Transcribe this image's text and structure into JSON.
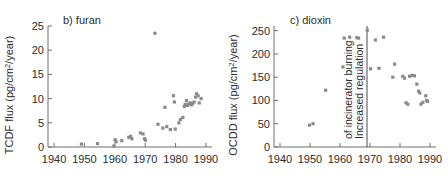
{
  "figure": {
    "marker_color": "#8a8a8a",
    "axis_color": "#6e6e6e",
    "text_color": "#2b2b2b"
  },
  "chart_data": [
    {
      "type": "scatter",
      "panel_id": "b",
      "title": "b) furan",
      "xlabel": "",
      "ylabel": "TCDF flux (pg/cm2/year)",
      "ylabel_main": "TCDF flux (pg/cm",
      "ylabel_sup": "2",
      "ylabel_tail": "/year)",
      "xlim": [
        1938,
        1992
      ],
      "ylim": [
        0,
        25
      ],
      "xticks": [
        1940,
        1950,
        1960,
        1970,
        1980,
        1990
      ],
      "yticks": [
        0,
        5,
        10,
        15,
        20,
        25
      ],
      "grid": false,
      "legend": "none",
      "points": [
        {
          "x": 1949.0,
          "y": 0.6
        },
        {
          "x": 1954.3,
          "y": 0.7
        },
        {
          "x": 1959.7,
          "y": 0.2
        },
        {
          "x": 1960.1,
          "y": 1.5
        },
        {
          "x": 1960.4,
          "y": 1.1
        },
        {
          "x": 1962.3,
          "y": 1.3
        },
        {
          "x": 1964.6,
          "y": 2.0
        },
        {
          "x": 1965.2,
          "y": 2.2
        },
        {
          "x": 1965.6,
          "y": 1.7
        },
        {
          "x": 1968.4,
          "y": 2.9
        },
        {
          "x": 1969.3,
          "y": 2.7
        },
        {
          "x": 1969.8,
          "y": 1.7
        },
        {
          "x": 1970.1,
          "y": 1.4
        },
        {
          "x": 1973.2,
          "y": 23.5
        },
        {
          "x": 1974.2,
          "y": 4.7
        },
        {
          "x": 1975.8,
          "y": 3.9
        },
        {
          "x": 1976.5,
          "y": 8.2
        },
        {
          "x": 1977.1,
          "y": 4.2
        },
        {
          "x": 1978.3,
          "y": 3.6
        },
        {
          "x": 1979.3,
          "y": 10.6
        },
        {
          "x": 1979.6,
          "y": 9.3
        },
        {
          "x": 1979.9,
          "y": 3.7
        },
        {
          "x": 1981.1,
          "y": 5.0
        },
        {
          "x": 1981.6,
          "y": 5.7
        },
        {
          "x": 1982.4,
          "y": 6.1
        },
        {
          "x": 1982.9,
          "y": 8.4
        },
        {
          "x": 1983.2,
          "y": 8.8
        },
        {
          "x": 1983.6,
          "y": 9.6
        },
        {
          "x": 1983.9,
          "y": 8.6
        },
        {
          "x": 1984.4,
          "y": 8.9
        },
        {
          "x": 1984.8,
          "y": 9.1
        },
        {
          "x": 1985.2,
          "y": 8.7
        },
        {
          "x": 1985.6,
          "y": 9.0
        },
        {
          "x": 1986.1,
          "y": 9.3
        },
        {
          "x": 1986.6,
          "y": 10.3
        },
        {
          "x": 1986.9,
          "y": 11.0
        },
        {
          "x": 1987.4,
          "y": 10.6
        },
        {
          "x": 1987.8,
          "y": 9.1
        },
        {
          "x": 1988.4,
          "y": 10.0
        }
      ]
    },
    {
      "type": "scatter",
      "panel_id": "c",
      "title": "c) dioxin",
      "xlabel": "",
      "ylabel": "OCDD flux (pg/cm2/year)",
      "ylabel_main": "OCDD flux (pg/cm",
      "ylabel_sup": "2",
      "ylabel_tail": "/year)",
      "xlim": [
        1938,
        1992
      ],
      "ylim": [
        0,
        260
      ],
      "xticks": [
        1940,
        1950,
        1960,
        1970,
        1980,
        1990
      ],
      "yticks": [
        0,
        50,
        100,
        150,
        200,
        250
      ],
      "grid": false,
      "legend": "none",
      "annotations": [
        {
          "text_line1": "Increased regulation",
          "text_line2": "of incinerator burning",
          "event_year": 1969,
          "line_y_top": 260,
          "line_y_bottom": 0
        }
      ],
      "points": [
        {
          "x": 1949.8,
          "y": 47
        },
        {
          "x": 1951.0,
          "y": 50
        },
        {
          "x": 1955.2,
          "y": 122
        },
        {
          "x": 1961.0,
          "y": 172
        },
        {
          "x": 1961.4,
          "y": 234
        },
        {
          "x": 1963.2,
          "y": 236
        },
        {
          "x": 1965.6,
          "y": 235
        },
        {
          "x": 1966.2,
          "y": 234
        },
        {
          "x": 1969.1,
          "y": 251
        },
        {
          "x": 1970.2,
          "y": 168
        },
        {
          "x": 1971.8,
          "y": 230
        },
        {
          "x": 1973.0,
          "y": 169
        },
        {
          "x": 1974.5,
          "y": 236
        },
        {
          "x": 1977.6,
          "y": 150
        },
        {
          "x": 1978.2,
          "y": 178
        },
        {
          "x": 1980.9,
          "y": 152
        },
        {
          "x": 1981.5,
          "y": 148
        },
        {
          "x": 1982.0,
          "y": 95
        },
        {
          "x": 1982.6,
          "y": 92
        },
        {
          "x": 1983.2,
          "y": 152
        },
        {
          "x": 1984.1,
          "y": 154
        },
        {
          "x": 1984.8,
          "y": 153
        },
        {
          "x": 1985.6,
          "y": 135
        },
        {
          "x": 1986.2,
          "y": 120
        },
        {
          "x": 1986.6,
          "y": 116
        },
        {
          "x": 1987.0,
          "y": 92
        },
        {
          "x": 1987.6,
          "y": 96
        },
        {
          "x": 1988.6,
          "y": 110
        },
        {
          "x": 1988.9,
          "y": 100
        },
        {
          "x": 1989.2,
          "y": 98
        }
      ]
    }
  ]
}
